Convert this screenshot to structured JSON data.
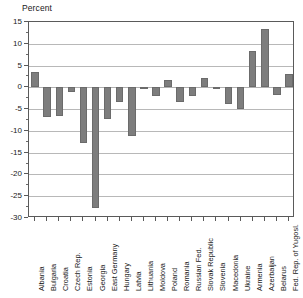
{
  "chart_data": {
    "type": "bar",
    "title": "Percent",
    "xlabel": "",
    "ylabel": "Percent",
    "ylim": [
      -30,
      15
    ],
    "ytick_step": 5,
    "grid": true,
    "legend": "none",
    "bar_color": "#7d7d7d",
    "categories": [
      "Albania",
      "Bulgaria",
      "Croatia",
      "Czech Rep.",
      "Estonia",
      "Georgia",
      "East Germany",
      "Hungary",
      "Latvia",
      "Lithuania",
      "Moldova",
      "Poland",
      "Romania",
      "Russian Fed.",
      "Slovak Republic",
      "Slovenia",
      "Macedonia",
      "Ukraine",
      "Armenia",
      "Azerbaijan",
      "Belarus",
      "Fed. Rep. of Yugosl."
    ],
    "values": [
      3.6,
      -6.9,
      -6.5,
      -1.0,
      -12.8,
      -27.7,
      -7.3,
      -3.3,
      -11.3,
      -0.5,
      -2.0,
      1.6,
      -3.4,
      -1.9,
      2.2,
      -0.3,
      -3.8,
      -5.1,
      8.4,
      13.3,
      -1.8,
      3.1
    ],
    "ytick_labels": [
      "15",
      "10",
      "5",
      "0",
      "-5",
      "-10",
      "-15",
      "-20",
      "-25",
      "-30"
    ],
    "ytick_values": [
      15,
      10,
      5,
      0,
      -5,
      -10,
      -15,
      -20,
      -25,
      -30
    ]
  },
  "footer": {
    "cut_text": ""
  }
}
